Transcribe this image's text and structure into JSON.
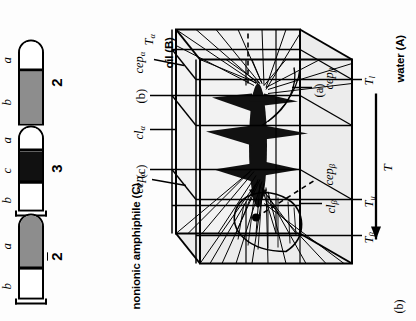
{
  "figure": {
    "panel_label": "(b)",
    "axes": {
      "vertex_top_left": "nonionic amphiphile (C)",
      "vertex_right_top": "oil (B)",
      "vertex_right_bottom": "water (A)",
      "temperature_axis": "T"
    },
    "annotations": {
      "cep_alpha": "cep",
      "cep_alpha_sub": "α",
      "cep_beta": "cep",
      "cep_beta_sub": "β",
      "cl_alpha": "cl",
      "cl_alpha_sub": "α",
      "cl_beta": "cl",
      "cl_beta_sub": "β",
      "T_alpha": "T",
      "T_alpha_sub": "α",
      "T_beta": "T",
      "T_beta_sub": "β",
      "T_u": "T",
      "T_u_sub": "u",
      "T_l": "T",
      "T_l_sub": "l",
      "section_a": "(a)",
      "section_b": "(b)",
      "section_c": "(c)"
    },
    "tubes": [
      {
        "name": "tube-2-upper",
        "number": "2",
        "overline": false,
        "phases": [
          {
            "label": "b",
            "fill": "gray"
          },
          {
            "label": "a",
            "fill": "white"
          }
        ],
        "has_cap": false
      },
      {
        "name": "tube-3",
        "number": "3",
        "overline": false,
        "phases": [
          {
            "label": "b",
            "fill": "white"
          },
          {
            "label": "c",
            "fill": "dark"
          },
          {
            "label": "a",
            "fill": "white"
          }
        ],
        "has_cap": true
      },
      {
        "name": "tube-2-lower",
        "number": "2",
        "overline": true,
        "phases": [
          {
            "label": "b",
            "fill": "white"
          },
          {
            "label": "a",
            "fill": "gray"
          }
        ],
        "has_cap": true
      }
    ],
    "colors": {
      "ink": "#000000",
      "gray_phase": "#8d8d8d",
      "dark_phase": "#111111",
      "shade": "#ececec",
      "background": "#fdfdfd"
    }
  }
}
